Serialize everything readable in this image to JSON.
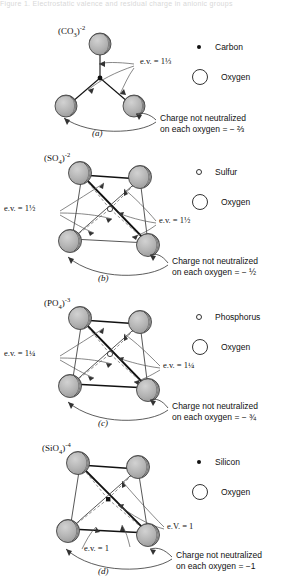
{
  "figure": {
    "cut_top_text": "Figure 1. Electrostatic valence and residual charge in anionic groups",
    "atom_style": {
      "sphere_fill": "#b0b0b0",
      "sphere_stroke": "#333333",
      "highlight": "#ffffff",
      "bond_color": "#111111",
      "thin_line": "#555555"
    }
  },
  "panels": [
    {
      "id": "a",
      "label": "(a)",
      "formula_base": "(CO",
      "formula_sub": "3",
      "formula_close": ")",
      "formula_sup": "-2",
      "legend": [
        {
          "name": "Carbon",
          "marker": "filled-dot"
        },
        {
          "name": "Oxygen",
          "marker": "large-circle"
        }
      ],
      "ev_labels": [
        {
          "text": "e.v. = 1⅓"
        }
      ],
      "callout_line1": "Charge not neutralized",
      "callout_line2": "on each oxygen = − ⅔",
      "geometry": "trigonal-planar",
      "oxygen_count": 3,
      "central_atom": "C",
      "central_marker": "filled-dot"
    },
    {
      "id": "b",
      "label": "(b)",
      "formula_base": "(SO",
      "formula_sub": "4",
      "formula_close": ")",
      "formula_sup": "-2",
      "legend": [
        {
          "name": "Sulfur",
          "marker": "open-dot"
        },
        {
          "name": "Oxygen",
          "marker": "large-circle"
        }
      ],
      "ev_labels": [
        {
          "text": "e.v. = 1½"
        },
        {
          "text": "e.v. = 1½"
        }
      ],
      "callout_line1": "Charge not neutralized",
      "callout_line2": "on each oxygen = − ½",
      "geometry": "tetrahedral",
      "oxygen_count": 4,
      "central_atom": "S",
      "central_marker": "open-dot"
    },
    {
      "id": "c",
      "label": "(c)",
      "formula_base": "(PO",
      "formula_sub": "4",
      "formula_close": ")",
      "formula_sup": "-3",
      "legend": [
        {
          "name": "Phosphorus",
          "marker": "open-dot"
        },
        {
          "name": "Oxygen",
          "marker": "large-circle"
        }
      ],
      "ev_labels": [
        {
          "text": "e.v. = 1¼"
        },
        {
          "text": "e.v. = 1¼"
        }
      ],
      "callout_line1": "Charge not neutralized",
      "callout_line2": "on each oxygen = − ¾",
      "geometry": "tetrahedral",
      "oxygen_count": 4,
      "central_atom": "P",
      "central_marker": "open-dot"
    },
    {
      "id": "d",
      "label": "(d)",
      "formula_base": "(SiO",
      "formula_sub": "4",
      "formula_close": ")",
      "formula_sup": "-4",
      "legend": [
        {
          "name": "Silicon",
          "marker": "filled-dot"
        },
        {
          "name": "Oxygen",
          "marker": "large-circle"
        }
      ],
      "ev_labels": [
        {
          "text": "e.V. = 1"
        },
        {
          "text": "e.v. = 1"
        }
      ],
      "callout_line1": "Charge not neutralized",
      "callout_line2": "on each oxygen = −1",
      "geometry": "tetrahedral",
      "oxygen_count": 4,
      "central_atom": "Si",
      "central_marker": "filled-dot"
    }
  ]
}
